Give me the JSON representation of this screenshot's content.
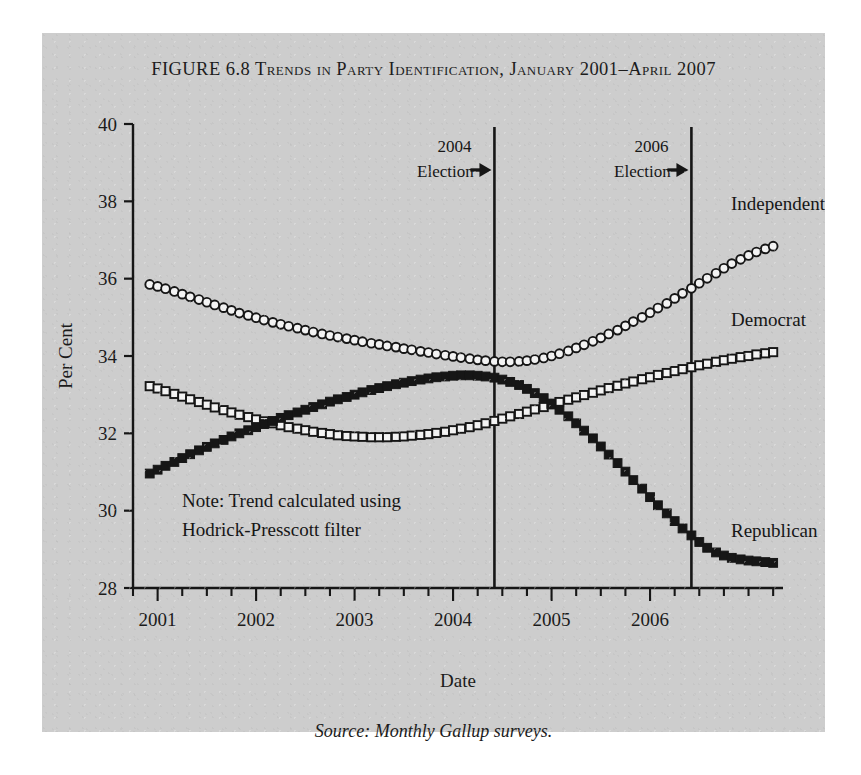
{
  "figure": {
    "title_lead": "Figure 6.8",
    "title_main": "Trends in Party Identification, January 2001–April 2007",
    "source": "Source: Monthly Gallup surveys.",
    "note_line1": "Note: Trend calculated using",
    "note_line2": "Hodrick-Presscott filter",
    "panel_color": "#cdcdcd",
    "ink_color": "#161616"
  },
  "chart_data": {
    "type": "line",
    "title": "FIGURE 6.8 TRENDS IN PARTY IDENTIFICATION, JANUARY 2001–APRIL 2007",
    "xlabel": "Date",
    "ylabel": "Per Cent",
    "xlim": [
      2000.75,
      2007.35
    ],
    "ylim": [
      28,
      40
    ],
    "yticks": [
      28,
      30,
      32,
      34,
      36,
      38,
      40
    ],
    "xticks": [
      2001,
      2002,
      2003,
      2004,
      2005,
      2006
    ],
    "xtick_labels": [
      "2001",
      "2002",
      "2003",
      "2004",
      "2005",
      "2006"
    ],
    "minor_xtick_interval": 0.25,
    "grid": false,
    "legend": "inline-right-labels",
    "marker_styles": {
      "Independent": "open-circle",
      "Democrat": "open-square",
      "Republican": "filled-square"
    },
    "annotations": [
      {
        "name": "2004-election",
        "line1": "2004",
        "line2": "Election",
        "x": 2004.42,
        "arrow": true
      },
      {
        "name": "2006-election",
        "line1": "2006",
        "line2": "Election",
        "x": 2006.42,
        "arrow": true
      }
    ],
    "x": [
      2000.92,
      2001.0,
      2001.08,
      2001.17,
      2001.25,
      2001.33,
      2001.42,
      2001.5,
      2001.58,
      2001.67,
      2001.75,
      2001.83,
      2001.92,
      2002.0,
      2002.08,
      2002.17,
      2002.25,
      2002.33,
      2002.42,
      2002.5,
      2002.58,
      2002.67,
      2002.75,
      2002.83,
      2002.92,
      2003.0,
      2003.08,
      2003.17,
      2003.25,
      2003.33,
      2003.42,
      2003.5,
      2003.58,
      2003.67,
      2003.75,
      2003.83,
      2003.92,
      2004.0,
      2004.08,
      2004.17,
      2004.25,
      2004.33,
      2004.42,
      2004.5,
      2004.58,
      2004.67,
      2004.75,
      2004.83,
      2004.92,
      2005.0,
      2005.08,
      2005.17,
      2005.25,
      2005.33,
      2005.42,
      2005.5,
      2005.58,
      2005.67,
      2005.75,
      2005.83,
      2005.92,
      2006.0,
      2006.08,
      2006.17,
      2006.25,
      2006.33,
      2006.42,
      2006.5,
      2006.58,
      2006.67,
      2006.75,
      2006.83,
      2006.92,
      2007.0,
      2007.08,
      2007.17,
      2007.25
    ],
    "series": [
      {
        "name": "Independent",
        "label": "Independent",
        "marker": "open-circle",
        "values": [
          35.85,
          35.8,
          35.74,
          35.67,
          35.6,
          35.53,
          35.46,
          35.39,
          35.32,
          35.25,
          35.18,
          35.11,
          35.05,
          34.99,
          34.93,
          34.87,
          34.82,
          34.77,
          34.72,
          34.67,
          34.62,
          34.57,
          34.53,
          34.49,
          34.45,
          34.41,
          34.37,
          34.33,
          34.3,
          34.26,
          34.23,
          34.19,
          34.16,
          34.12,
          34.09,
          34.05,
          34.02,
          33.99,
          33.96,
          33.93,
          33.9,
          33.88,
          33.86,
          33.85,
          33.85,
          33.86,
          33.88,
          33.91,
          33.95,
          34.0,
          34.06,
          34.13,
          34.21,
          34.29,
          34.38,
          34.47,
          34.57,
          34.67,
          34.78,
          34.89,
          35.0,
          35.12,
          35.24,
          35.36,
          35.49,
          35.62,
          35.75,
          35.88,
          36.01,
          36.14,
          36.27,
          36.39,
          36.5,
          36.6,
          36.69,
          36.77,
          36.84
        ]
      },
      {
        "name": "Democrat",
        "label": "Democrat",
        "marker": "open-square",
        "values": [
          33.22,
          33.16,
          33.09,
          33.02,
          32.95,
          32.88,
          32.81,
          32.74,
          32.67,
          32.6,
          32.54,
          32.48,
          32.42,
          32.36,
          32.31,
          32.26,
          32.21,
          32.16,
          32.12,
          32.08,
          32.04,
          32.01,
          31.98,
          31.95,
          31.93,
          31.92,
          31.91,
          31.9,
          31.9,
          31.9,
          31.91,
          31.92,
          31.94,
          31.96,
          31.98,
          32.01,
          32.04,
          32.08,
          32.12,
          32.16,
          32.21,
          32.26,
          32.32,
          32.38,
          32.44,
          32.5,
          32.56,
          32.62,
          32.68,
          32.75,
          32.81,
          32.87,
          32.93,
          32.99,
          33.05,
          33.11,
          33.17,
          33.23,
          33.29,
          33.34,
          33.4,
          33.45,
          33.51,
          33.56,
          33.61,
          33.66,
          33.71,
          33.76,
          33.8,
          33.85,
          33.89,
          33.93,
          33.97,
          34.0,
          34.04,
          34.07,
          34.1
        ]
      },
      {
        "name": "Republican",
        "label": "Republican",
        "marker": "filled-square",
        "values": [
          30.96,
          31.06,
          31.16,
          31.26,
          31.36,
          31.46,
          31.56,
          31.65,
          31.74,
          31.83,
          31.92,
          32.0,
          32.08,
          32.16,
          32.24,
          32.32,
          32.4,
          32.47,
          32.54,
          32.61,
          32.68,
          32.75,
          32.82,
          32.88,
          32.94,
          33.0,
          33.06,
          33.12,
          33.17,
          33.22,
          33.27,
          33.31,
          33.35,
          33.39,
          33.42,
          33.45,
          33.47,
          33.49,
          33.5,
          33.5,
          33.49,
          33.47,
          33.44,
          33.39,
          33.33,
          33.25,
          33.15,
          33.04,
          32.91,
          32.77,
          32.61,
          32.44,
          32.26,
          32.07,
          31.87,
          31.66,
          31.45,
          31.23,
          31.01,
          30.79,
          30.57,
          30.35,
          30.14,
          29.93,
          29.73,
          29.54,
          29.36,
          29.19,
          29.04,
          28.92,
          28.84,
          28.78,
          28.74,
          28.71,
          28.69,
          28.67,
          28.65
        ]
      }
    ]
  }
}
